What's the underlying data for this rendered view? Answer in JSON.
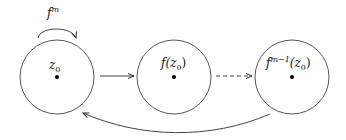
{
  "diagram": {
    "type": "orbit-diagram",
    "nodes": [
      {
        "id": "z0",
        "label": "z₀",
        "label_html_base": "z",
        "label_sub": "0"
      },
      {
        "id": "fz0",
        "label": "f(z₀)"
      },
      {
        "id": "fm1z0",
        "label": "f^{m-1}(z₀)"
      }
    ],
    "self_loop": {
      "label_base": "f",
      "label_sup": "m",
      "on": "z0"
    },
    "edges": [
      {
        "from": "z0",
        "to": "fz0",
        "style": "solid"
      },
      {
        "from": "fz0",
        "to": "fm1z0",
        "style": "dashed"
      },
      {
        "from": "fm1z0",
        "to": "z0",
        "style": "solid-curved"
      }
    ],
    "labels": {
      "z0_base": "z",
      "z0_sub": "0",
      "fz0_prefix": "f(",
      "fz0_base": "z",
      "fz0_sub": "0",
      "fz0_suffix": ")",
      "fm1_base": "f",
      "fm1_sup": "m−1",
      "fm1_paren": "(z",
      "fm1_sub": "0",
      "fm1_close": ")",
      "loop_base": "f",
      "loop_sup": "m"
    },
    "stroke_color": "#444444"
  }
}
